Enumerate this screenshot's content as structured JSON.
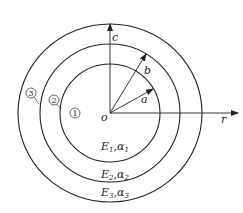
{
  "diagram": {
    "type": "concentric-cylinders-cross-section",
    "origin_label": "o",
    "axes": {
      "vertical_label": "c",
      "horizontal_label": "r"
    },
    "radii": [
      {
        "label": "a",
        "description": "inner radius"
      },
      {
        "label": "b",
        "description": "middle radius"
      }
    ],
    "layer_markers": [
      "1",
      "2",
      "3"
    ],
    "layers": [
      {
        "E": "E",
        "E_sub": "1",
        "sep": ",",
        "alpha": "α",
        "alpha_sub": "1"
      },
      {
        "E": "E",
        "E_sub": "2",
        "sep": ",",
        "alpha": "α",
        "alpha_sub": "2"
      },
      {
        "E": "E",
        "E_sub": "3",
        "sep": ",",
        "alpha": "α",
        "alpha_sub": "3"
      }
    ],
    "colors": {
      "line": "#222222",
      "background": "#ffffff"
    }
  }
}
